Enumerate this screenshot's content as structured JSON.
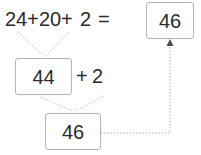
{
  "diagram": {
    "colors": {
      "text": "#2b2b2b",
      "box_border": "#b4b4b4",
      "box_fill": "#ffffff",
      "wire": "#b9b9b9",
      "arrow": "#4a4a4a",
      "background": "#ffffff"
    },
    "equation": {
      "term1": "24",
      "plus1": "+",
      "term2": "20",
      "plus2": "+",
      "term3": "2",
      "equals": "=",
      "result": "46"
    },
    "step1": {
      "sum": "44",
      "plus": "+",
      "addend": "2"
    },
    "step2": {
      "total": "46"
    },
    "connectors": [
      {
        "name": "term1-to-sum",
        "from": "24",
        "to": "44",
        "style": "dotted"
      },
      {
        "name": "term2-to-sum",
        "from": "20",
        "to": "44",
        "style": "dotted"
      },
      {
        "name": "sum-to-total",
        "from": "44",
        "to": "46",
        "style": "dotted"
      },
      {
        "name": "addend-to-total",
        "from": "2",
        "to": "46",
        "style": "dotted"
      },
      {
        "name": "total-to-result",
        "from": "46",
        "to": "46",
        "style": "dotted-arrow"
      }
    ]
  }
}
